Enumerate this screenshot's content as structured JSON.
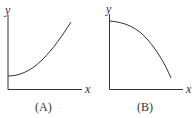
{
  "graphs": [
    {
      "label": "(A)",
      "x_axis": "x",
      "y_axis": "y",
      "curve": "increasing, concave up, starting at positive y-intercept"
    },
    {
      "label": "(B)",
      "x_axis": "x",
      "y_axis": "y",
      "curve": "decreasing, concave down, starting at maximum on y-axis"
    }
  ],
  "colors": {
    "line": "#333333"
  }
}
